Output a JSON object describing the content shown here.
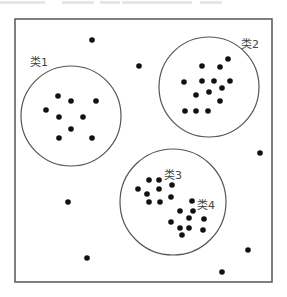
{
  "diagram": {
    "type": "cluster-scatter",
    "frame": {
      "x": 15,
      "y": 19,
      "width": 257,
      "height": 263,
      "stroke": "#555555"
    },
    "clusters": [
      {
        "label": "类1",
        "label_pos": [
          30,
          66
        ],
        "circle": {
          "cx": 71,
          "cy": 116,
          "r": 50
        },
        "points": [
          [
            58,
            96
          ],
          [
            71,
            101
          ],
          [
            96,
            101
          ],
          [
            46,
            110
          ],
          [
            59,
            117
          ],
          [
            83,
            117
          ],
          [
            71,
            129
          ],
          [
            59,
            138
          ],
          [
            92,
            138
          ]
        ]
      },
      {
        "label": "类2",
        "label_pos": [
          241,
          48
        ],
        "circle": {
          "cx": 209,
          "cy": 87,
          "r": 50
        },
        "points": [
          [
            228,
            59
          ],
          [
            202,
            66
          ],
          [
            220,
            67
          ],
          [
            184,
            82
          ],
          [
            202,
            81
          ],
          [
            214,
            81
          ],
          [
            230,
            81
          ],
          [
            222,
            88
          ],
          [
            209,
            92
          ],
          [
            196,
            95
          ],
          [
            220,
            101
          ],
          [
            185,
            111
          ],
          [
            196,
            111
          ],
          [
            208,
            111
          ]
        ]
      },
      {
        "label": "类3",
        "label_pos": [
          164,
          179
        ],
        "circle": {
          "cx": 173,
          "cy": 202,
          "r": 53
        },
        "points": [
          [
            149,
            180
          ],
          [
            159,
            180
          ],
          [
            172,
            185
          ],
          [
            138,
            189
          ],
          [
            159,
            189
          ],
          [
            147,
            194
          ],
          [
            171,
            197
          ],
          [
            149,
            202
          ],
          [
            160,
            202
          ]
        ]
      },
      {
        "label": "类4",
        "label_pos": [
          197,
          209
        ],
        "circle": null,
        "points": [
          [
            192,
            201
          ],
          [
            180,
            211
          ],
          [
            193,
            211
          ],
          [
            189,
            218
          ],
          [
            204,
            219
          ],
          [
            171,
            222
          ],
          [
            180,
            228
          ],
          [
            189,
            228
          ],
          [
            203,
            230
          ],
          [
            182,
            235
          ]
        ]
      }
    ],
    "outliers": [
      [
        92,
        40
      ],
      [
        139,
        66
      ],
      [
        260,
        153
      ],
      [
        68,
        202
      ],
      [
        87,
        258
      ],
      [
        248,
        250
      ],
      [
        222,
        272
      ]
    ],
    "colors": {
      "point": "#111111",
      "circle": "#555555",
      "label": "#444444"
    }
  }
}
